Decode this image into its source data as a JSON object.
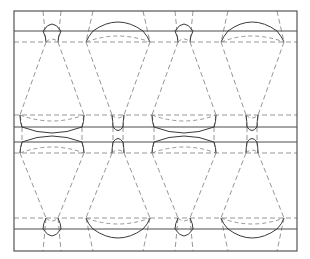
{
  "figure": {
    "title": "Periodic tiling diagram with cone and lens cells",
    "width": 310,
    "height": 259,
    "background_color": "#ffffff",
    "solid_stroke_color": "#4d4d4d",
    "dashed_stroke_color": "#8a8a8a",
    "curve_stroke_color": "#3a3a3a",
    "frame_stroke_color": "#555555",
    "solid_stroke_width": 1.0,
    "dashed_stroke_width": 0.9,
    "dash_pattern": "5,3"
  },
  "frame": {
    "name": "outer-border",
    "x": 14,
    "y": 11,
    "width": 283,
    "height": 240
  },
  "horizontal_lines": [
    {
      "id": "h-solid-1",
      "style": "solid",
      "y": 31
    },
    {
      "id": "h-dash-1",
      "style": "dashed",
      "y": 42
    },
    {
      "id": "h-dash-2",
      "style": "dashed",
      "y": 115
    },
    {
      "id": "h-solid-2",
      "style": "solid",
      "y": 127
    },
    {
      "id": "h-solid-3",
      "style": "solid",
      "y": 142
    },
    {
      "id": "h-dash-3",
      "style": "dashed",
      "y": 153
    },
    {
      "id": "h-dash-4",
      "style": "dashed",
      "y": 218
    },
    {
      "id": "h-solid-4",
      "style": "solid",
      "y": 229
    }
  ],
  "band_rows": [
    {
      "id": "row-top",
      "solid_y": 31,
      "dash_y": 42
    },
    {
      "id": "row-mid-a",
      "dash_y": 115,
      "solid_y": 127
    },
    {
      "id": "row-mid-b",
      "solid_y": 142,
      "dash_y": 153
    },
    {
      "id": "row-bottom",
      "dash_y": 218,
      "solid_y": 229
    }
  ],
  "node_columns": [
    {
      "id": "col-1",
      "x": 52,
      "type": "narrow"
    },
    {
      "id": "col-2",
      "x": 118,
      "type": "wide"
    },
    {
      "id": "col-3",
      "x": 184,
      "type": "narrow"
    },
    {
      "id": "col-4",
      "x": 252,
      "type": "wide"
    }
  ],
  "vertical_dash_x_top": [
    43,
    61,
    93,
    143,
    175,
    193,
    228,
    277
  ],
  "vertical_dash_x_bottom": [
    43,
    61,
    93,
    143,
    175,
    193,
    228,
    277
  ],
  "cells": {
    "narrow_half_width": 12,
    "wide_half_width": 46,
    "cone_top_half_width": 12,
    "cone_bottom_half_width": 46,
    "arc_bulge": 11
  },
  "legend": {
    "solid_label": "solid boundary",
    "dashed_label": "dashed construction line",
    "curve_label": "circular arc"
  }
}
